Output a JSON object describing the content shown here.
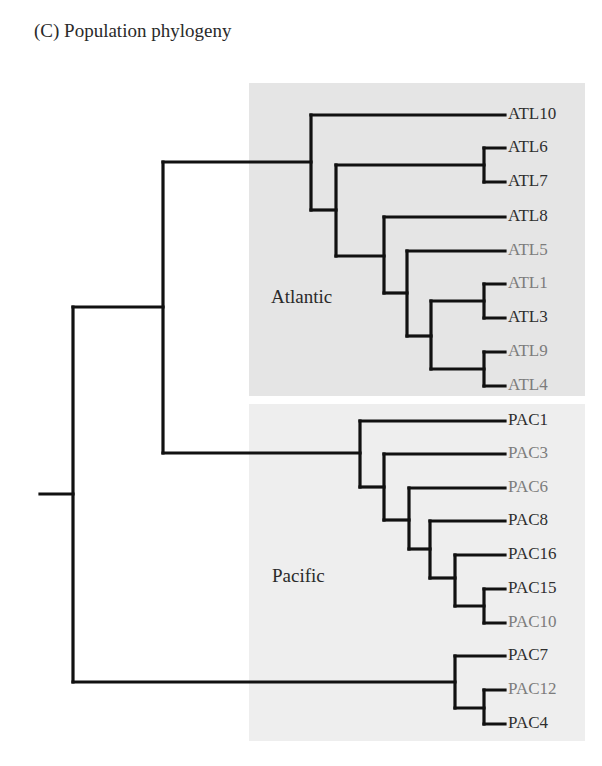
{
  "title": "(C)  Population phylogeny",
  "colors": {
    "atlantic_bg": "#e5e5e5",
    "pacific_bg": "#eeeeee",
    "branch": "#111111",
    "label_dark": "#2e2e2e",
    "label_gray": "#7c7c7c"
  },
  "regions": {
    "atlantic": {
      "label": "Atlantic"
    },
    "pacific": {
      "label": "Pacific"
    }
  },
  "leaves": [
    {
      "name": "ATL10",
      "region": "Atlantic",
      "shade": "dark",
      "y": 115
    },
    {
      "name": "ATL6",
      "region": "Atlantic",
      "shade": "dark",
      "y": 148
    },
    {
      "name": "ATL7",
      "region": "Atlantic",
      "shade": "dark",
      "y": 182
    },
    {
      "name": "ATL8",
      "region": "Atlantic",
      "shade": "dark",
      "y": 217
    },
    {
      "name": "ATL5",
      "region": "Atlantic",
      "shade": "gray",
      "y": 251
    },
    {
      "name": "ATL1",
      "region": "Atlantic",
      "shade": "gray",
      "y": 284
    },
    {
      "name": "ATL3",
      "region": "Atlantic",
      "shade": "dark",
      "y": 318
    },
    {
      "name": "ATL9",
      "region": "Atlantic",
      "shade": "gray",
      "y": 352
    },
    {
      "name": "ATL4",
      "region": "Atlantic",
      "shade": "gray",
      "y": 386
    },
    {
      "name": "PAC1",
      "region": "Pacific",
      "shade": "dark",
      "y": 421
    },
    {
      "name": "PAC3",
      "region": "Pacific",
      "shade": "gray",
      "y": 454
    },
    {
      "name": "PAC6",
      "region": "Pacific",
      "shade": "gray",
      "y": 488
    },
    {
      "name": "PAC8",
      "region": "Pacific",
      "shade": "dark",
      "y": 521
    },
    {
      "name": "PAC16",
      "region": "Pacific",
      "shade": "dark",
      "y": 555
    },
    {
      "name": "PAC15",
      "region": "Pacific",
      "shade": "dark",
      "y": 589
    },
    {
      "name": "PAC10",
      "region": "Pacific",
      "shade": "gray",
      "y": 623
    },
    {
      "name": "PAC7",
      "region": "Pacific",
      "shade": "dark",
      "y": 656
    },
    {
      "name": "PAC12",
      "region": "Pacific",
      "shade": "gray",
      "y": 690
    },
    {
      "name": "PAC4",
      "region": "Pacific",
      "shade": "dark",
      "y": 724
    }
  ],
  "tree_newick": "(((ATL10,((ATL6,ATL7),(ATL8,(ATL5,((ATL1,ATL3),(ATL9,ATL4)))))),(PAC1,(PAC3,(PAC6,(PAC8,(PAC16,(PAC15,PAC10))))))),(PAC7,(PAC12,PAC4)));"
}
